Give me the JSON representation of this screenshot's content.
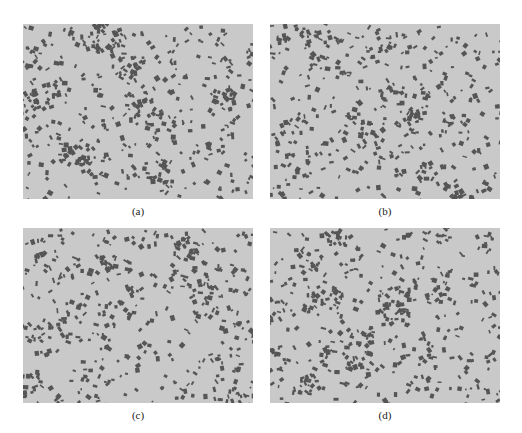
{
  "figure": {
    "panels": [
      {
        "id": "a",
        "label": "(a)",
        "x": 23,
        "y": 24,
        "seed": 11,
        "blobs": 520,
        "bg": "#c9c9c9",
        "fg": "#555555"
      },
      {
        "id": "b",
        "label": "(b)",
        "x": 270,
        "y": 24,
        "seed": 23,
        "blobs": 470,
        "bg": "#c9c9c9",
        "fg": "#555555"
      },
      {
        "id": "c",
        "label": "(c)",
        "x": 23,
        "y": 228,
        "seed": 37,
        "blobs": 480,
        "bg": "#c9c9c9",
        "fg": "#555555"
      },
      {
        "id": "d",
        "label": "(d)",
        "x": 270,
        "y": 228,
        "seed": 51,
        "blobs": 500,
        "bg": "#c9c9c9",
        "fg": "#555555"
      }
    ]
  }
}
